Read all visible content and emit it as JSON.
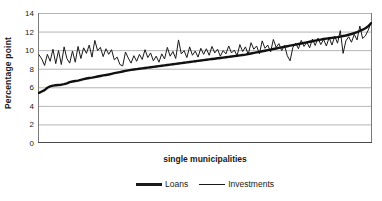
{
  "chart_data": {
    "type": "line",
    "title": "",
    "xlabel": "single municipalities",
    "ylabel": "Percentage point",
    "ylim": [
      0,
      14
    ],
    "ytick_step": 2,
    "yticks": [
      14,
      12,
      10,
      8,
      6,
      4,
      2,
      0
    ],
    "xticks_visible": true,
    "xtick_labels": [],
    "grid": "horizontal",
    "legend_position": "bottom",
    "colors": {
      "line": "#1a1a1a",
      "grid": "#b4b4b4",
      "axis": "#808080",
      "background": "#ffffff"
    },
    "x_count": 120,
    "series": [
      {
        "name": "Loans",
        "width": "thick",
        "values": [
          5.4,
          5.55,
          5.7,
          5.95,
          6.1,
          6.18,
          6.22,
          6.25,
          6.28,
          6.34,
          6.42,
          6.55,
          6.62,
          6.68,
          6.72,
          6.8,
          6.88,
          6.95,
          7.0,
          7.04,
          7.1,
          7.16,
          7.22,
          7.28,
          7.32,
          7.38,
          7.45,
          7.52,
          7.58,
          7.64,
          7.7,
          7.76,
          7.82,
          7.88,
          7.92,
          7.96,
          8.0,
          8.04,
          8.08,
          8.12,
          8.16,
          8.2,
          8.24,
          8.28,
          8.32,
          8.36,
          8.4,
          8.44,
          8.48,
          8.52,
          8.56,
          8.6,
          8.64,
          8.68,
          8.72,
          8.76,
          8.8,
          8.84,
          8.88,
          8.92,
          8.96,
          9.0,
          9.04,
          9.08,
          9.12,
          9.16,
          9.2,
          9.24,
          9.28,
          9.32,
          9.36,
          9.4,
          9.44,
          9.48,
          9.52,
          9.58,
          9.64,
          9.7,
          9.76,
          9.82,
          9.88,
          9.94,
          10.0,
          10.06,
          10.12,
          10.18,
          10.24,
          10.3,
          10.36,
          10.42,
          10.48,
          10.54,
          10.6,
          10.66,
          10.72,
          10.78,
          10.84,
          10.9,
          10.96,
          11.02,
          11.08,
          11.14,
          11.2,
          11.24,
          11.28,
          11.32,
          11.36,
          11.4,
          11.46,
          11.52,
          11.58,
          11.66,
          11.74,
          11.84,
          11.94,
          12.06,
          12.2,
          12.36,
          12.56,
          12.9
        ]
      },
      {
        "name": "Investments",
        "width": "thin",
        "values": [
          9.5,
          9.05,
          8.35,
          9.55,
          8.8,
          10.1,
          8.55,
          9.95,
          8.45,
          10.35,
          9.1,
          8.6,
          9.9,
          8.7,
          10.4,
          9.1,
          10.25,
          9.65,
          10.55,
          9.25,
          11.05,
          9.95,
          10.3,
          9.3,
          10.15,
          9.55,
          10.05,
          8.95,
          9.25,
          8.45,
          8.3,
          9.8,
          9.15,
          8.6,
          9.4,
          8.8,
          9.55,
          9.0,
          10.05,
          9.2,
          9.7,
          8.85,
          9.35,
          8.7,
          9.6,
          9.05,
          10.3,
          9.35,
          9.85,
          9.1,
          11.1,
          9.6,
          9.95,
          9.2,
          10.35,
          9.45,
          9.9,
          9.25,
          10.2,
          9.55,
          10.15,
          9.45,
          10.4,
          9.7,
          10.1,
          9.35,
          9.95,
          9.6,
          10.45,
          9.7,
          10.0,
          9.4,
          10.6,
          9.85,
          10.35,
          9.55,
          10.8,
          10.1,
          10.45,
          9.6,
          11.0,
          10.2,
          10.55,
          9.8,
          11.15,
          10.3,
          10.7,
          9.95,
          10.5,
          9.4,
          8.85,
          10.3,
          10.75,
          10.15,
          11.05,
          10.4,
          10.85,
          10.25,
          11.2,
          10.5,
          11.3,
          10.6,
          11.15,
          10.45,
          11.35,
          10.55,
          11.5,
          10.75,
          12.1,
          9.65,
          11.0,
          11.45,
          10.85,
          11.7,
          11.1,
          12.6,
          11.25,
          11.55,
          12.15,
          12.95
        ]
      }
    ]
  },
  "legend": {
    "entries": [
      {
        "label": "Loans"
      },
      {
        "label": "Investments"
      }
    ]
  }
}
